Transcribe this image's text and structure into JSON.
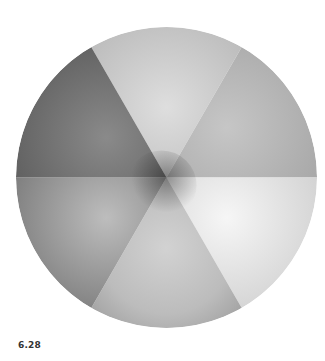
{
  "figure": {
    "caption": "6.28",
    "segments": [
      {
        "position": "top",
        "base_color": "#c4c4c4",
        "highlight": "#dedede"
      },
      {
        "position": "upper-right",
        "base_color": "#b0b0b0",
        "highlight": "#c8c8c8"
      },
      {
        "position": "lower-right",
        "base_color": "#d8d8d8",
        "highlight": "#f4f4f4"
      },
      {
        "position": "bottom",
        "base_color": "#b4b4b4",
        "highlight": "#d2d2d2"
      },
      {
        "position": "lower-left",
        "base_color": "#8a8a8a",
        "highlight": "#c0c0c0"
      },
      {
        "position": "upper-left",
        "base_color": "#6a6a6a",
        "highlight": "#8c8c8c"
      }
    ]
  }
}
